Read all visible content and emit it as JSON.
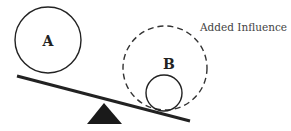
{
  "diagram": {
    "circle_a": {
      "label": "A"
    },
    "circle_b": {
      "label": "B"
    },
    "added_influence": {
      "label": "Added Influence"
    },
    "colors": {
      "stroke": "#222222",
      "fulcrum": "#1a1a1a",
      "text": "#444444"
    }
  }
}
